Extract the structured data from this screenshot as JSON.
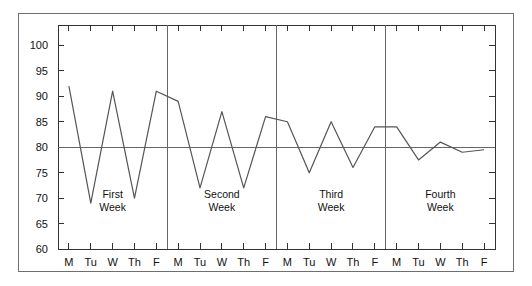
{
  "chart_data": {
    "type": "line",
    "title": "",
    "subtitle": "",
    "xlabel": "",
    "ylabel": "",
    "ylim": [
      60,
      104
    ],
    "xlim": [
      0,
      20
    ],
    "grid": false,
    "legend": "none",
    "y_ticks": [
      60,
      65,
      70,
      75,
      80,
      85,
      90,
      95,
      100
    ],
    "y_tick_labels": [
      "60",
      "65",
      "70",
      "75",
      "80",
      "85",
      "90",
      "95",
      "100"
    ],
    "categories": [
      "M",
      "Tu",
      "W",
      "Th",
      "F",
      "M",
      "Tu",
      "W",
      "Th",
      "F",
      "M",
      "Tu",
      "W",
      "Th",
      "F",
      "M",
      "Tu",
      "W",
      "Th",
      "F"
    ],
    "values": [
      92,
      69,
      91,
      70,
      91,
      89,
      72,
      87,
      72,
      86,
      85,
      75,
      85,
      76,
      84,
      84,
      77.5,
      81,
      79,
      79.5
    ],
    "reference_line": {
      "value": 80,
      "orientation": "horizontal",
      "label": ""
    },
    "separators": {
      "orientation": "vertical",
      "at_categories": [
        5,
        10,
        15
      ],
      "note": "vertical rules drawn at each Monday boundary"
    },
    "annotations": [
      {
        "text_line1": "First",
        "text_line2": "Week",
        "center_category_index": 2,
        "value": 70
      },
      {
        "text_line1": "Second",
        "text_line2": "Week",
        "center_category_index": 7,
        "value": 70
      },
      {
        "text_line1": "Third",
        "text_line2": "Week",
        "center_category_index": 12,
        "value": 70
      },
      {
        "text_line1": "Fourth",
        "text_line2": "Week",
        "center_category_index": 17,
        "value": 70
      }
    ],
    "colors": {
      "line": "#555555",
      "axis": "#333333",
      "reference_line": "#666666",
      "separator": "#666666",
      "border": "#6f6f6f",
      "text": "#111111",
      "background": "#ffffff"
    }
  }
}
